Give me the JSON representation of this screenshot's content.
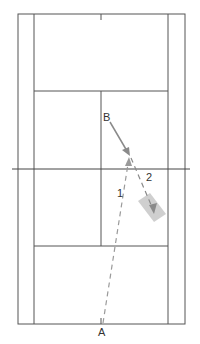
{
  "diagram": {
    "type": "tennis-court-drill",
    "labels": {
      "point_a": "A",
      "point_b": "B",
      "path_1": "1",
      "path_2": "2"
    },
    "colors": {
      "court_lines": "#555555",
      "paths": "#8a8a8a",
      "target_zone": "#cfcfcf"
    }
  }
}
